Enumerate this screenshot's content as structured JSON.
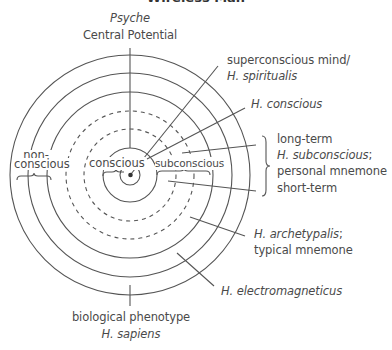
{
  "title": "Wireless Man",
  "diagram": {
    "type": "concentric-circles",
    "center": {
      "x": 130,
      "y": 175
    },
    "rings": [
      {
        "r": 2,
        "style": "dot"
      },
      {
        "r": 10,
        "style": "solid"
      },
      {
        "r": 27,
        "style": "solid"
      },
      {
        "r": 46,
        "style": "dashed"
      },
      {
        "r": 64,
        "style": "dashed"
      },
      {
        "r": 83,
        "style": "solid"
      },
      {
        "r": 102,
        "style": "solid"
      },
      {
        "r": 120,
        "style": "solid"
      }
    ],
    "colors": {
      "line": "#555555",
      "text": "#4a4a4a"
    }
  },
  "labels": {
    "top_italic": "Psyche",
    "top": "Central Potential",
    "superconscious_line1": "superconscious mind/",
    "superconscious_line2": "H. spiritualis",
    "h_conscious": "H. conscious",
    "long_term": "long-term",
    "h_subconscious": "H. subconscious",
    "h_subconscious_suffix": ";",
    "personal_mnemone": "personal mnemone",
    "short_term": "short-term",
    "h_archetypalis": "H. archetypalis",
    "h_archetypalis_suffix": ";",
    "typical_mnemone": "typical mnemone",
    "h_electromagneticus": "H. electromagneticus",
    "biological_phenotype": "biological phenotype",
    "h_sapiens": "H. sapiens",
    "non": "non-",
    "nonconscious": "conscious",
    "conscious": "conscious",
    "subconscious": "subconscious"
  }
}
